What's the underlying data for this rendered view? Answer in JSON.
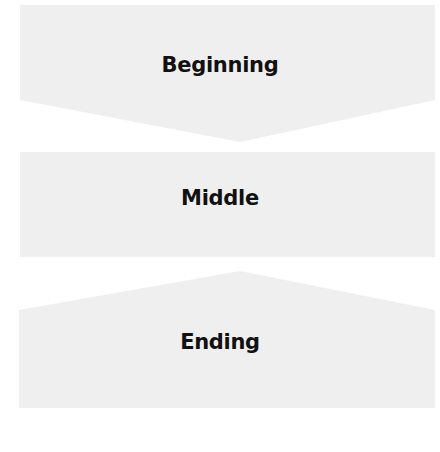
{
  "diagram": {
    "fill_color": "#efefef",
    "text_color": "#111111",
    "stages": [
      {
        "label": "Beginning",
        "shape": "down-arrow-pentagon"
      },
      {
        "label": "Middle",
        "shape": "rectangle"
      },
      {
        "label": "Ending",
        "shape": "up-pointed-pentagon"
      }
    ]
  }
}
